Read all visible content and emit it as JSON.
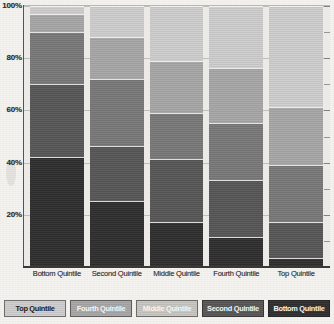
{
  "chart_data": {
    "type": "bar",
    "subtype": "stacked-100-percent",
    "title": "",
    "xlabel": "",
    "ylabel": "",
    "ylim": [
      0,
      100
    ],
    "grid": true,
    "legend_position": "bottom",
    "categories": [
      "Bottom Quintile",
      "Second Quintile",
      "Middle Quintile",
      "Fourth Quintile",
      "Top Quintile"
    ],
    "y_ticks": [
      "20%",
      "40%",
      "60%",
      "80%",
      "100%"
    ],
    "y_tick_values": [
      20,
      40,
      60,
      80,
      100
    ],
    "series": [
      {
        "name": "Bottom Quintile",
        "color": "#2e2e2e",
        "values": [
          42,
          25,
          17,
          11,
          3
        ]
      },
      {
        "name": "Second Quintile",
        "color": "#565656",
        "values": [
          28,
          21,
          24,
          22,
          14
        ]
      },
      {
        "name": "Middle Quintile",
        "color": "#787878",
        "values": [
          20,
          26,
          18,
          22,
          22
        ]
      },
      {
        "name": "Fourth Quintile",
        "color": "#a6a6a6",
        "values": [
          7,
          16,
          20,
          21,
          22
        ]
      },
      {
        "name": "Top Quintile",
        "color": "#cdcdcd",
        "values": [
          3,
          12,
          21,
          24,
          39
        ]
      }
    ],
    "legend": [
      {
        "label": "Top Quintile",
        "color": "#cdcdcd",
        "text_color": "#1d1b19"
      },
      {
        "label": "Fourth Quintile",
        "color": "#a6a6a6",
        "text_color": "#f5f4f1"
      },
      {
        "label": "Middle Quintile",
        "color": "#c6c5c1",
        "text_color": "#f5f4f1"
      },
      {
        "label": "Second Quintile",
        "color": "#565656",
        "text_color": "#f5f4f1"
      },
      {
        "label": "Bottom Quintile",
        "color": "#2e2e2e",
        "text_color": "#f5f4f1"
      }
    ],
    "stack_order_bottom_to_top": [
      "Bottom Quintile",
      "Second Quintile",
      "Middle Quintile",
      "Fourth Quintile",
      "Top Quintile"
    ],
    "bars": [
      {
        "category": "Bottom Quintile",
        "segments": [
          42,
          28,
          20,
          7,
          3
        ]
      },
      {
        "category": "Second Quintile",
        "segments": [
          25,
          21,
          26,
          16,
          12
        ]
      },
      {
        "category": "Middle Quintile",
        "segments": [
          17,
          24,
          18,
          20,
          21
        ]
      },
      {
        "category": "Fourth Quintile",
        "segments": [
          11,
          22,
          22,
          21,
          24
        ]
      },
      {
        "category": "Top Quintile",
        "segments": [
          3,
          14,
          22,
          22,
          39
        ]
      }
    ]
  }
}
